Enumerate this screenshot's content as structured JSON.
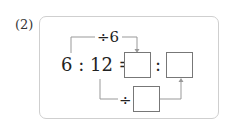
{
  "problem": {
    "number_label": "(2)",
    "expression": "6 : 12 =",
    "ratio_colon": ":",
    "top_operator": "÷6",
    "bottom_operator": "÷",
    "answer_boxes": [
      "",
      "",
      ""
    ]
  },
  "colors": {
    "frame_border": "#cfcfcf",
    "line": "#999999",
    "text": "#222222"
  }
}
